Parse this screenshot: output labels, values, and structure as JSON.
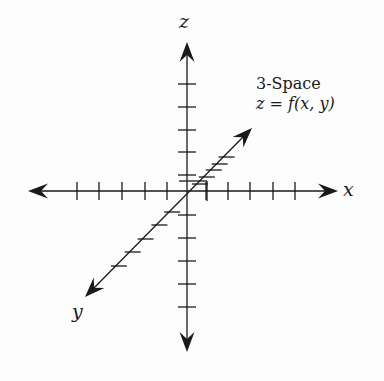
{
  "diagram": {
    "title": "3-Space",
    "equation": {
      "lhs": "z",
      "eq": " = ",
      "func": "f",
      "args": "(x, y)"
    },
    "axes": {
      "x": {
        "label": "x"
      },
      "y": {
        "label": "y"
      },
      "z": {
        "label": "z"
      }
    },
    "colors": {
      "stroke": "#1a1a1a",
      "background": "#fdfdfd"
    },
    "geometry": {
      "origin": [
        187,
        191
      ],
      "x_axis": {
        "left": 28,
        "right": 338,
        "ticks": [
          77,
          99,
          122,
          145,
          167,
          206,
          228,
          250,
          273,
          295
        ]
      },
      "z_axis": {
        "top": 42,
        "bottom": 352,
        "ticks": [
          84,
          107,
          130,
          152,
          175,
          215,
          238,
          261,
          284,
          307
        ]
      },
      "y_axis": {
        "start": [
          252,
          128
        ],
        "end": [
          85,
          297
        ]
      }
    }
  }
}
